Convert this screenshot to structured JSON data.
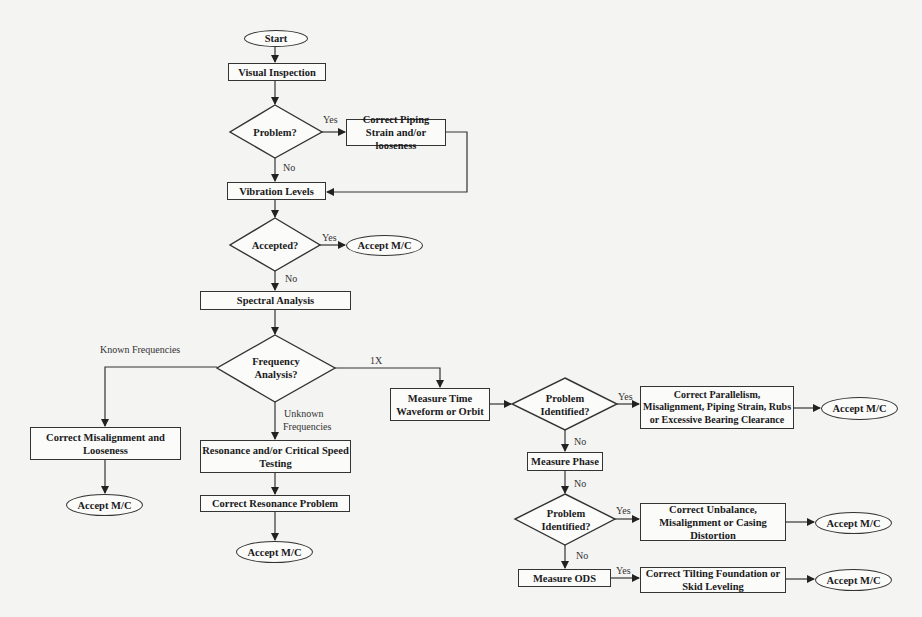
{
  "diagram": {
    "type": "flowchart",
    "nodes": {
      "start": "Start",
      "visual_inspection": "Visual Inspection",
      "problem": "Problem?",
      "correct_piping": "Correct Piping Strain and/or looseness",
      "vibration_levels": "Vibration Levels",
      "accepted": "Accepted?",
      "accept_1": "Accept M/C",
      "spectral_analysis": "Spectral Analysis",
      "frequency_analysis": "Frequency Analysis?",
      "correct_misalignment": "Correct Misalignment and Looseness",
      "accept_2": "Accept M/C",
      "resonance_testing": "Resonance and/or Critical Speed Testing",
      "correct_resonance": "Correct Resonance Problem",
      "accept_3": "Accept M/C",
      "measure_time_waveform": "Measure Time Waveform or Orbit",
      "problem_identified_1": "Problem Identified?",
      "correct_parallelism": "Correct Parallelism, Misalignment, Piping Strain, Rubs or Excessive Bearing Clearance",
      "accept_4": "Accept M/C",
      "measure_phase": "Measure Phase",
      "problem_identified_2": "Problem Identified?",
      "correct_unbalance": "Correct Unbalance, Misalignment or Casing Distortion",
      "accept_5": "Accept M/C",
      "measure_ods": "Measure ODS",
      "correct_tilting": "Correct Tilting Foundation or Skid Leveling",
      "accept_6": "Accept M/C"
    },
    "edge_labels": {
      "problem_yes": "Yes",
      "problem_no": "No",
      "accepted_yes": "Yes",
      "accepted_no": "No",
      "known_frequencies": "Known Frequencies",
      "one_x": "1X",
      "unknown_frequencies_1": "Unknown",
      "unknown_frequencies_2": "Frequencies",
      "pi1_yes": "Yes",
      "pi1_no": "No",
      "phase_no": "No",
      "pi2_yes": "Yes",
      "pi2_no": "No",
      "ods_yes": "Yes"
    },
    "colors": {
      "line": "#333333",
      "background": "#f4f4f2",
      "node_fill": "#fbfbfa"
    }
  }
}
